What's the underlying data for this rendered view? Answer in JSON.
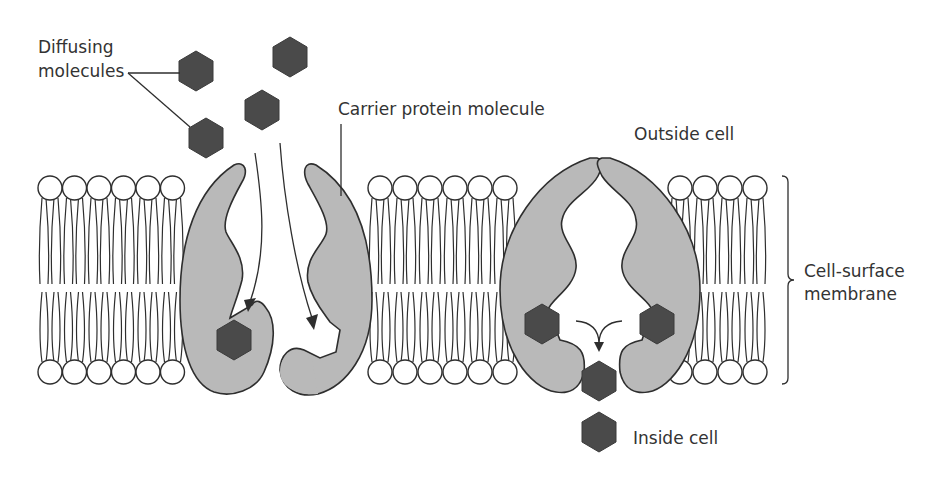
{
  "labels": {
    "diffusing_line1": "Diffusing",
    "diffusing_line2": "molecules",
    "carrier": "Carrier protein molecule",
    "outside": "Outside cell",
    "inside": "Inside cell",
    "membrane_line1": "Cell-surface",
    "membrane_line2": "membrane"
  },
  "colors": {
    "protein_fill": "#b9b9b9",
    "molecule_fill": "#4a4a4a",
    "outline": "#2e2e2e",
    "text": "#333333"
  },
  "membrane": {
    "segments": [
      {
        "x_start": 52,
        "count": 6
      },
      {
        "x_start": 383,
        "count": 6
      },
      {
        "x_start": 684,
        "count": 4
      }
    ],
    "head_spacing": 24.5,
    "top_y": 188,
    "bottom_y": 372
  }
}
